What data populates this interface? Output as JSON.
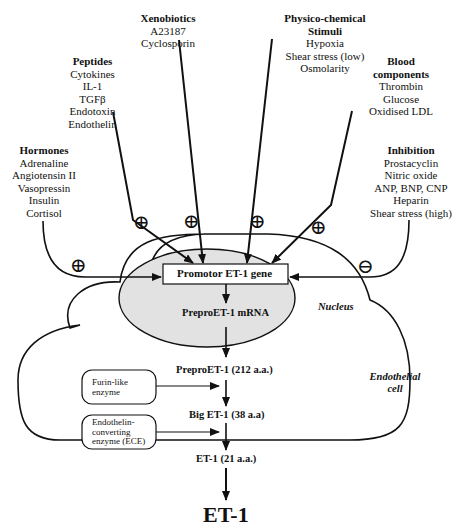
{
  "groups": {
    "xenobiotics": {
      "title": "Xenobiotics",
      "items": [
        "A23187",
        "Cyclosporin"
      ]
    },
    "physico": {
      "title_line1": "Physico-chemical",
      "title_line2": "Stimuli",
      "items": [
        "Hypoxia",
        "Shear stress (low)",
        "Osmolarity"
      ]
    },
    "peptides": {
      "title": "Peptides",
      "items": [
        "Cytokines",
        "IL-1",
        "TGFβ",
        "Endotoxin",
        "Endothelin"
      ]
    },
    "blood": {
      "title_line1": "Blood",
      "title_line2": "components",
      "items": [
        "Thrombin",
        "Glucose",
        "Oxidised LDL"
      ]
    },
    "hormones": {
      "title": "Hormones",
      "items": [
        "Adrenaline",
        "Angiotensin II",
        "Vasopressin",
        "Insulin",
        "Cortisol"
      ]
    },
    "inhibition": {
      "title": "Inhibition",
      "items": [
        "Prostacyclin",
        "Nitric oxide",
        "ANP, BNP, CNP",
        "Heparin",
        "Shear stress (high)"
      ]
    }
  },
  "signs": {
    "plus": "⊕",
    "minus": "⊖"
  },
  "nucleus": {
    "label": "Nucleus",
    "promotor": "Promotor ET-1 gene",
    "mrna": "PreproET-1 mRNA",
    "fill": "#e2e2e2"
  },
  "cell": {
    "label_line1": "Endothelial",
    "label_line2": "cell"
  },
  "pathway": {
    "prepro": "PreproET-1 (212 a.a.)",
    "big": "Big ET-1 (38 a.a)",
    "et1": "ET-1 (21 a.a.)"
  },
  "enzymes": {
    "furin": [
      "Furin-like",
      "enzyme"
    ],
    "ece": [
      "Endothelin-",
      "converting",
      "enzyme (ECE)"
    ]
  },
  "output": "ET-1"
}
